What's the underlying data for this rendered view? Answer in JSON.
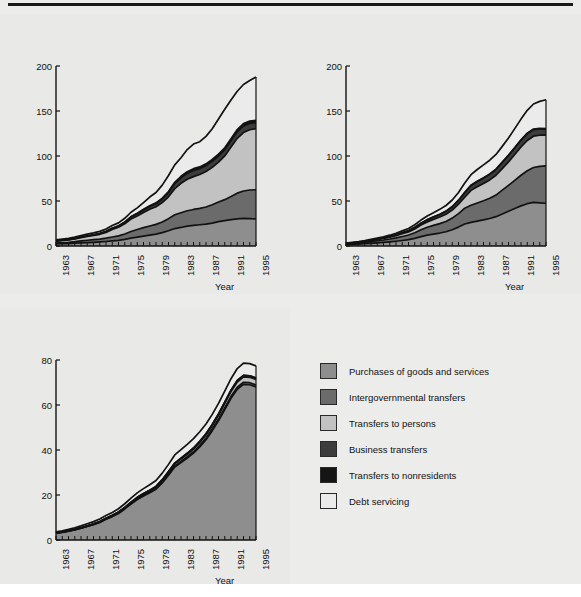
{
  "figure": {
    "top_rule": true,
    "background": "#ececea",
    "axis_unit_label": "Billions of $",
    "x_axis_label": "Year"
  },
  "colors": {
    "purchases": "#8e8e8e",
    "intergovernmental": "#6b6b6b",
    "persons": "#c2c2c2",
    "business": "#3c3c3c",
    "nonresidents": "#151515",
    "debt": "#ebebeb",
    "line": "#121212",
    "text": "#111111",
    "panel_bg": "#e9e9e7"
  },
  "legend": {
    "items": [
      {
        "label": "Purchases of goods and services",
        "color": "#8e8e8e"
      },
      {
        "label": "Intergovernmental transfers",
        "color": "#6b6b6b"
      },
      {
        "label": "Transfers to persons",
        "color": "#c2c2c2"
      },
      {
        "label": "Business transfers",
        "color": "#3c3c3c"
      },
      {
        "label": "Transfers to nonresidents",
        "color": "#151515"
      },
      {
        "label": "Debt servicing",
        "color": "#ebebeb"
      }
    ]
  },
  "chart_data": [
    {
      "type": "area",
      "stacked": true,
      "title": "(a) Federal",
      "xlabel": "Year",
      "ylabel": "Billions of $",
      "xlim": [
        1963,
        1995
      ],
      "ylim": [
        0,
        200
      ],
      "yticks": [
        0,
        50,
        100,
        150,
        200
      ],
      "xticks": [
        1963,
        1967,
        1971,
        1975,
        1979,
        1983,
        1987,
        1991,
        1995
      ],
      "grid": false,
      "legend_position": "external-right",
      "x": [
        1963,
        1964,
        1965,
        1966,
        1967,
        1968,
        1969,
        1970,
        1971,
        1972,
        1973,
        1974,
        1975,
        1976,
        1977,
        1978,
        1979,
        1980,
        1981,
        1982,
        1983,
        1984,
        1985,
        1986,
        1987,
        1988,
        1989,
        1990,
        1991,
        1992,
        1993,
        1994,
        1995
      ],
      "series": [
        {
          "name": "Purchases of goods and services",
          "values": [
            2.3,
            2.5,
            2.7,
            3.1,
            3.5,
            3.8,
            4.1,
            4.5,
            5.0,
            5.6,
            6.3,
            7.4,
            8.8,
            9.9,
            11.0,
            12.1,
            13.2,
            14.8,
            17.0,
            19.4,
            20.6,
            22.0,
            23.0,
            23.6,
            24.3,
            25.5,
            27.0,
            28.2,
            29.4,
            30.2,
            30.6,
            30.4,
            30.0
          ]
        },
        {
          "name": "Intergovernmental transfers",
          "values": [
            1.0,
            1.2,
            1.4,
            1.7,
            2.2,
            2.6,
            2.9,
            3.2,
            3.7,
            4.4,
            5.0,
            6.0,
            7.3,
            8.4,
            9.4,
            10.1,
            10.8,
            11.9,
            13.4,
            15.3,
            16.3,
            17.2,
            17.6,
            18.2,
            19.0,
            20.3,
            21.8,
            23.3,
            25.5,
            28.5,
            30.5,
            31.8,
            32.5
          ]
        },
        {
          "name": "Transfers to persons",
          "values": [
            2.2,
            2.4,
            2.6,
            3.0,
            3.6,
            4.2,
            4.7,
            5.3,
            6.4,
            8.4,
            9.5,
            11.2,
            13.8,
            15.0,
            16.8,
            18.6,
            19.6,
            21.6,
            24.3,
            29.0,
            32.8,
            35.0,
            36.5,
            37.6,
            39.4,
            41.6,
            44.4,
            48.6,
            55.0,
            61.0,
            65.0,
            67.0,
            68.0
          ]
        },
        {
          "name": "Business transfers",
          "values": [
            0.3,
            0.3,
            0.4,
            0.4,
            0.5,
            0.6,
            0.6,
            0.7,
            0.9,
            1.1,
            1.3,
            1.7,
            2.2,
            2.4,
            2.8,
            3.1,
            3.3,
            3.8,
            4.5,
            5.6,
            6.1,
            6.6,
            6.9,
            6.6,
            6.6,
            6.6,
            6.7,
            6.8,
            7.0,
            7.2,
            7.3,
            7.0,
            6.6
          ]
        },
        {
          "name": "Transfers to nonresidents",
          "values": [
            0.1,
            0.1,
            0.1,
            0.2,
            0.2,
            0.2,
            0.2,
            0.3,
            0.3,
            0.4,
            0.4,
            0.5,
            0.6,
            0.7,
            0.8,
            0.9,
            1.0,
            1.1,
            1.3,
            1.5,
            1.7,
            1.8,
            1.9,
            1.9,
            2.0,
            2.1,
            2.2,
            2.3,
            2.4,
            2.5,
            2.6,
            2.6,
            2.6
          ]
        },
        {
          "name": "Debt servicing",
          "values": [
            1.0,
            1.1,
            1.2,
            1.4,
            1.6,
            1.8,
            2.1,
            2.3,
            2.5,
            2.8,
            3.2,
            4.0,
            4.8,
            6.0,
            7.4,
            9.6,
            11.6,
            14.4,
            17.8,
            19.4,
            20.6,
            24.6,
            27.4,
            28.0,
            30.5,
            34.2,
            39.0,
            42.8,
            43.0,
            42.5,
            43.5,
            45.0,
            48.0
          ]
        }
      ]
    },
    {
      "type": "area",
      "stacked": true,
      "title": "(b) Provincial",
      "xlabel": "Year",
      "ylabel": "Billions of $",
      "xlim": [
        1963,
        1995
      ],
      "ylim": [
        0,
        200
      ],
      "yticks": [
        0,
        50,
        100,
        150,
        200
      ],
      "xticks": [
        1963,
        1967,
        1971,
        1975,
        1979,
        1983,
        1987,
        1991,
        1995
      ],
      "grid": false,
      "legend_position": "external-right",
      "x": [
        1963,
        1964,
        1965,
        1966,
        1967,
        1968,
        1969,
        1970,
        1971,
        1972,
        1973,
        1974,
        1975,
        1976,
        1977,
        1978,
        1979,
        1980,
        1981,
        1982,
        1983,
        1984,
        1985,
        1986,
        1987,
        1988,
        1989,
        1990,
        1991,
        1992,
        1993,
        1994,
        1995
      ],
      "series": [
        {
          "name": "Purchases of goods and services",
          "values": [
            1.4,
            1.7,
            2.0,
            2.5,
            3.0,
            3.5,
            4.0,
            4.6,
            5.3,
            6.1,
            7.0,
            8.5,
            10.4,
            12.0,
            13.2,
            14.4,
            15.8,
            18.0,
            21.0,
            24.4,
            26.2,
            27.6,
            29.0,
            30.6,
            32.6,
            35.6,
            38.6,
            41.6,
            44.6,
            47.0,
            48.4,
            48.0,
            47.5
          ]
        },
        {
          "name": "Intergovernmental transfers",
          "values": [
            0.8,
            1.0,
            1.2,
            1.5,
            1.9,
            2.3,
            2.7,
            3.2,
            3.8,
            4.5,
            5.2,
            6.3,
            7.6,
            8.8,
            9.7,
            10.5,
            11.5,
            13.0,
            15.0,
            17.6,
            19.0,
            20.2,
            21.2,
            22.4,
            24.0,
            26.4,
            28.8,
            31.4,
            34.0,
            36.6,
            38.8,
            40.5,
            41.6
          ]
        },
        {
          "name": "Transfers to persons",
          "values": [
            0.5,
            0.6,
            0.7,
            0.9,
            1.1,
            1.4,
            1.7,
            2.0,
            2.4,
            3.0,
            3.5,
            4.2,
            5.2,
            6.0,
            6.7,
            7.3,
            8.0,
            9.0,
            10.4,
            12.2,
            16.6,
            18.0,
            19.2,
            20.4,
            22.0,
            24.0,
            26.0,
            28.6,
            31.4,
            33.6,
            34.8,
            34.6,
            34.2
          ]
        },
        {
          "name": "Business transfers",
          "values": [
            0.2,
            0.2,
            0.3,
            0.3,
            0.4,
            0.5,
            0.6,
            0.7,
            0.9,
            1.1,
            1.3,
            1.6,
            2.0,
            2.3,
            2.6,
            2.9,
            3.2,
            3.6,
            4.2,
            5.0,
            5.4,
            5.8,
            6.0,
            6.2,
            6.4,
            6.8,
            7.0,
            7.2,
            7.4,
            7.6,
            7.4,
            7.0,
            6.6
          ]
        },
        {
          "name": "Transfers to nonresidents",
          "values": [
            0.0,
            0.0,
            0.0,
            0.0,
            0.1,
            0.1,
            0.1,
            0.1,
            0.1,
            0.1,
            0.1,
            0.2,
            0.2,
            0.2,
            0.2,
            0.2,
            0.3,
            0.3,
            0.3,
            0.4,
            0.4,
            0.4,
            0.5,
            0.5,
            0.5,
            0.5,
            0.6,
            0.6,
            0.6,
            0.6,
            0.6,
            0.6,
            0.6
          ]
        },
        {
          "name": "Debt servicing",
          "values": [
            0.4,
            0.5,
            0.6,
            0.7,
            0.9,
            1.0,
            1.2,
            1.4,
            1.7,
            2.0,
            2.3,
            2.8,
            3.4,
            4.0,
            4.6,
            5.4,
            6.2,
            7.2,
            8.6,
            10.4,
            11.6,
            13.0,
            14.2,
            15.2,
            16.2,
            17.4,
            19.0,
            21.0,
            23.0,
            25.4,
            27.8,
            30.0,
            32.0
          ]
        }
      ]
    },
    {
      "type": "area",
      "stacked": true,
      "title": "(c) Local",
      "xlabel": "Year",
      "ylabel": "Billions of $",
      "xlim": [
        1963,
        1995
      ],
      "ylim": [
        0,
        80
      ],
      "yticks": [
        0,
        20,
        40,
        60,
        80
      ],
      "xticks": [
        1963,
        1967,
        1971,
        1975,
        1979,
        1983,
        1987,
        1991,
        1995
      ],
      "grid": false,
      "legend_position": "external-right",
      "x": [
        1963,
        1964,
        1965,
        1966,
        1967,
        1968,
        1969,
        1970,
        1971,
        1972,
        1973,
        1974,
        1975,
        1976,
        1977,
        1978,
        1979,
        1980,
        1981,
        1982,
        1983,
        1984,
        1985,
        1986,
        1987,
        1988,
        1989,
        1990,
        1991,
        1992,
        1993,
        1994,
        1995
      ],
      "series": [
        {
          "name": "Purchases of goods and services",
          "values": [
            3.0,
            3.4,
            3.9,
            4.5,
            5.2,
            6.0,
            6.8,
            7.8,
            9.2,
            10.4,
            11.8,
            13.8,
            16.0,
            18.0,
            19.6,
            21.0,
            22.6,
            25.4,
            28.8,
            32.4,
            34.4,
            36.4,
            38.6,
            41.4,
            44.6,
            48.6,
            53.0,
            58.0,
            63.0,
            67.0,
            69.2,
            69.0,
            68.0
          ]
        },
        {
          "name": "Intergovernmental transfers",
          "values": [
            0.05,
            0.06,
            0.07,
            0.08,
            0.1,
            0.1,
            0.12,
            0.14,
            0.16,
            0.18,
            0.2,
            0.22,
            0.25,
            0.28,
            0.3,
            0.32,
            0.35,
            0.4,
            0.45,
            0.5,
            0.55,
            0.6,
            0.62,
            0.65,
            0.68,
            0.7,
            0.75,
            0.8,
            0.85,
            0.9,
            0.9,
            0.9,
            0.9
          ]
        },
        {
          "name": "Transfers to persons",
          "values": [
            0.05,
            0.06,
            0.07,
            0.08,
            0.1,
            0.12,
            0.14,
            0.16,
            0.2,
            0.24,
            0.28,
            0.32,
            0.4,
            0.46,
            0.5,
            0.55,
            0.6,
            0.7,
            0.8,
            0.9,
            1.0,
            1.1,
            1.2,
            1.3,
            1.4,
            1.5,
            1.7,
            1.9,
            2.1,
            2.3,
            2.4,
            2.4,
            2.4
          ]
        },
        {
          "name": "Business transfers",
          "values": [
            0.05,
            0.05,
            0.06,
            0.06,
            0.07,
            0.08,
            0.09,
            0.1,
            0.12,
            0.13,
            0.15,
            0.17,
            0.2,
            0.22,
            0.24,
            0.26,
            0.28,
            0.32,
            0.36,
            0.4,
            0.42,
            0.44,
            0.46,
            0.48,
            0.5,
            0.52,
            0.55,
            0.6,
            0.65,
            0.7,
            0.7,
            0.7,
            0.7
          ]
        },
        {
          "name": "Transfers to nonresidents",
          "values": [
            0,
            0,
            0,
            0,
            0,
            0,
            0,
            0,
            0,
            0,
            0,
            0,
            0,
            0,
            0,
            0,
            0,
            0,
            0,
            0,
            0,
            0,
            0,
            0,
            0,
            0,
            0,
            0,
            0,
            0,
            0,
            0,
            0
          ]
        },
        {
          "name": "Debt servicing",
          "values": [
            0.5,
            0.55,
            0.6,
            0.7,
            0.8,
            0.9,
            1.0,
            1.1,
            1.2,
            1.3,
            1.45,
            1.6,
            1.8,
            2.0,
            2.2,
            2.4,
            2.6,
            2.9,
            3.2,
            3.6,
            3.8,
            4.0,
            4.2,
            4.3,
            4.4,
            4.5,
            4.7,
            4.9,
            5.1,
            5.3,
            5.4,
            5.4,
            5.4
          ]
        }
      ]
    }
  ]
}
